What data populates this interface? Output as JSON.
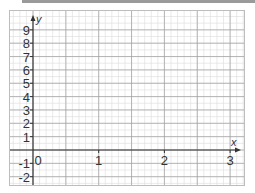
{
  "chart_data": {
    "type": "line",
    "title": "",
    "xlabel": "x",
    "ylabel": "y",
    "x_ticks": [
      "0",
      "1",
      "2",
      "3"
    ],
    "y_ticks": [
      "9",
      "8",
      "7",
      "6",
      "5",
      "4",
      "3",
      "2",
      "1",
      "-1",
      "-2"
    ],
    "xlim": [
      -0.05,
      3.1
    ],
    "ylim": [
      -2.5,
      9.6
    ],
    "grid": true,
    "minor_grid": true,
    "series": [],
    "legend": null
  },
  "colors": {
    "axis": "#333333",
    "major_grid": "#9e9e9e",
    "minor_grid": "#dcdcdc",
    "frame": "#bdbdbd"
  }
}
